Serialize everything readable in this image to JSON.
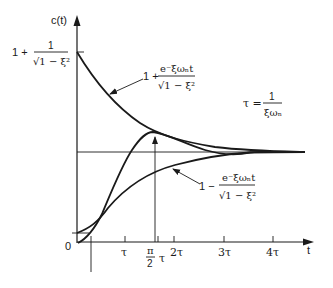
{
  "figure": {
    "y_axis_label": "c(t)",
    "x_axis_label": "t",
    "origin_label": "0",
    "upper_start_label": {
      "lead": "1 +",
      "num": "1",
      "den": "√1 − ξ²"
    },
    "upper_envelope_label": {
      "lead": "1 +",
      "num": "e⁻ξωₙt",
      "den": "√1 − ξ²"
    },
    "lower_envelope_label": {
      "lead": "1 −",
      "num": "e⁻ξωₙt",
      "den": "√1 − ξ²"
    },
    "time_constant_label": {
      "lead": "τ =",
      "num": "1",
      "den": "ξωₙ"
    },
    "ticks": [
      {
        "label": "τ",
        "x": 125
      },
      {
        "label": "τ",
        "x": 160,
        "note": "after π/2"
      },
      {
        "label": "2τ",
        "x": 174
      },
      {
        "label": "3τ",
        "x": 224
      },
      {
        "label": "4τ",
        "x": 273
      }
    ],
    "peak_time_label": {
      "num": "π",
      "den": "2"
    },
    "colors": {
      "ink": "#1a1a1a",
      "background": "#ffffff"
    }
  }
}
